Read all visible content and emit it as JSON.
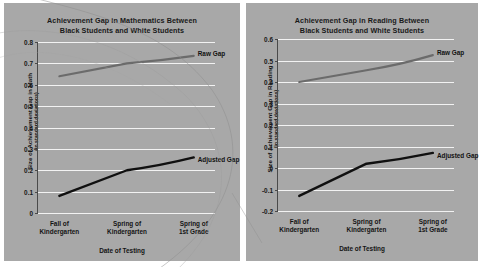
{
  "figure": {
    "background": "#ffffff",
    "panel_background": "#a8a8a8",
    "gridline_color": "#f2f2f2",
    "raw_gap_color": "#6b6b6b",
    "adjusted_gap_color": "#101010"
  },
  "charts": [
    {
      "id": "math",
      "title_line1": "Achievement Gap in Mathematics Between",
      "title_line2": "Black Students and White Students",
      "ylabel_main": "Size of Achievement Gap in Math",
      "ylabel_sub": "(in standard deviations)",
      "xlabel": "Date of Testing",
      "yticks": [
        "0.8",
        "0.7",
        "0.6",
        "0.5",
        "0.4",
        "0.3",
        "0.2",
        "0.1",
        "0"
      ],
      "categories_l1": [
        "Fall of",
        "Spring of",
        "Spring of"
      ],
      "categories_l2": [
        "Kindergarten",
        "Kindergarten",
        "1st Grade"
      ],
      "series": [
        {
          "name": "Raw Gap",
          "label": "Raw Gap",
          "color": "#6b6b6b",
          "values": [
            0.64,
            0.7,
            0.735
          ]
        },
        {
          "name": "Adjusted Gap",
          "label": "Adjusted Gap",
          "color": "#101010",
          "values": [
            0.08,
            0.2,
            0.26
          ]
        }
      ]
    },
    {
      "id": "reading",
      "title_line1": "Achievement Gap in Reading Between",
      "title_line2": "Black Students and White Students",
      "ylabel_main": "Size of Achievement Gap in Reading",
      "ylabel_sub": "(in standard deviations)",
      "xlabel": "Date of Testing",
      "yticks": [
        "0.6",
        "0.5",
        "0.4",
        "0.3",
        "0.2",
        "0.1",
        "0",
        "-0.1",
        "-0.2"
      ],
      "categories_l1": [
        "Fall of",
        "Spring of",
        "Spring of"
      ],
      "categories_l2": [
        "Kindergarten",
        "Kindergarten",
        "1st Grade"
      ],
      "series": [
        {
          "name": "Raw Gap",
          "label": "Raw Gap",
          "color": "#6b6b6b",
          "values": [
            0.4,
            0.455,
            0.525
          ]
        },
        {
          "name": "Adjusted Gap",
          "label": "Adjusted Gap",
          "color": "#101010",
          "values": [
            -0.13,
            0.02,
            0.07
          ]
        }
      ]
    }
  ],
  "chart_data": [
    {
      "type": "line",
      "title": "Achievement Gap in Mathematics Between Black Students and White Students",
      "xlabel": "Date of Testing",
      "ylabel": "Size of Achievement Gap in Math (in standard deviations)",
      "categories": [
        "Fall of Kindergarten",
        "Spring of Kindergarten",
        "Spring of 1st Grade"
      ],
      "series": [
        {
          "name": "Raw Gap",
          "values": [
            0.64,
            0.7,
            0.735
          ]
        },
        {
          "name": "Adjusted Gap",
          "values": [
            0.08,
            0.2,
            0.26
          ]
        }
      ],
      "ylim": [
        0,
        0.8
      ],
      "yticks": [
        0,
        0.1,
        0.2,
        0.3,
        0.4,
        0.5,
        0.6,
        0.7,
        0.8
      ],
      "grid": true,
      "legend": "inline-annotation"
    },
    {
      "type": "line",
      "title": "Achievement Gap in Reading Between Black Students and White Students",
      "xlabel": "Date of Testing",
      "ylabel": "Size of Achievement Gap in Reading (in standard deviations)",
      "categories": [
        "Fall of Kindergarten",
        "Spring of Kindergarten",
        "Spring of 1st Grade"
      ],
      "series": [
        {
          "name": "Raw Gap",
          "values": [
            0.4,
            0.455,
            0.525
          ]
        },
        {
          "name": "Adjusted Gap",
          "values": [
            -0.13,
            0.02,
            0.07
          ]
        }
      ],
      "ylim": [
        -0.2,
        0.6
      ],
      "yticks": [
        -0.2,
        -0.1,
        0,
        0.1,
        0.2,
        0.3,
        0.4,
        0.5,
        0.6
      ],
      "grid": true,
      "legend": "inline-annotation"
    }
  ]
}
